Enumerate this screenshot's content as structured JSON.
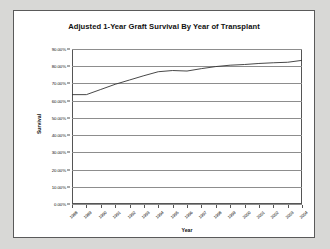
{
  "chart_data": {
    "type": "line",
    "title": "Adjusted 1-Year Graft Survival By Year of Transplant",
    "xlabel": "Year",
    "ylabel": "Survival",
    "grid": true,
    "legend": false,
    "categories": [
      "1988",
      "1989",
      "1990",
      "1991",
      "1992",
      "1993",
      "1994",
      "1995",
      "1996",
      "1997",
      "1998",
      "1999",
      "2000",
      "2001",
      "2002",
      "2003",
      "2004"
    ],
    "x": [
      1988,
      1989,
      1990,
      1991,
      1992,
      1993,
      1994,
      1995,
      1996,
      1997,
      1998,
      1999,
      2000,
      2001,
      2002,
      2003,
      2004
    ],
    "values": [
      63.5,
      63.5,
      66.5,
      69.5,
      72.0,
      74.5,
      76.8,
      77.5,
      77.2,
      78.6,
      79.8,
      80.6,
      81.0,
      81.6,
      82.0,
      82.3,
      83.4
    ],
    "series": [
      {
        "name": "Adjusted 1-Year Graft Survival",
        "values": [
          63.5,
          63.5,
          66.5,
          69.5,
          72.0,
          74.5,
          76.8,
          77.5,
          77.2,
          78.6,
          79.8,
          80.6,
          81.0,
          81.6,
          82.0,
          82.3,
          83.4
        ]
      }
    ],
    "ylim": [
      0,
      90
    ],
    "ytick_values": [
      0,
      10,
      20,
      30,
      40,
      50,
      60,
      70,
      80,
      90
    ],
    "ytick_labels": [
      "0.00%",
      "10.00%",
      "20.00%",
      "30.00%",
      "40.00%",
      "50.00%",
      "60.00%",
      "70.00%",
      "80.00%",
      "90.00%"
    ],
    "xlim": [
      1988,
      2004
    ],
    "line_color": "#333333",
    "plot_background": "#ffffff",
    "gridline_color": "#8d8d8d",
    "axis_color": "#555555",
    "page_background": "#d8d8d6"
  }
}
